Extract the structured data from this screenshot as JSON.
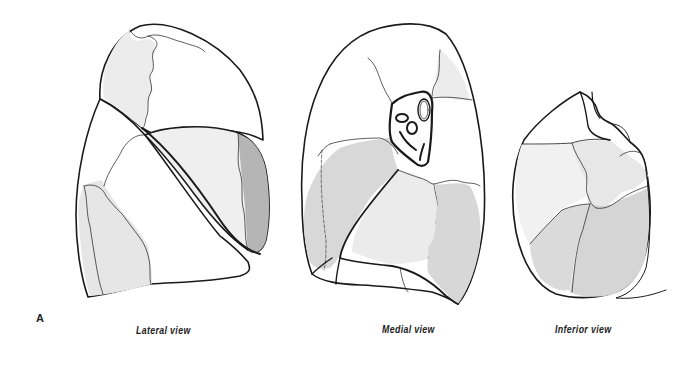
{
  "figure": {
    "panel_letter": "A",
    "views": [
      {
        "id": "lateral",
        "label": "Lateral view"
      },
      {
        "id": "medial",
        "label": "Medial view"
      },
      {
        "id": "inferior",
        "label": "Inferior view"
      }
    ]
  },
  "colors": {
    "outline": "#1a1a1a",
    "light_shade": "#ececec",
    "mid_shade": "#d9d9d9",
    "dark_shade": "#b3b3b3",
    "background": "#ffffff"
  }
}
